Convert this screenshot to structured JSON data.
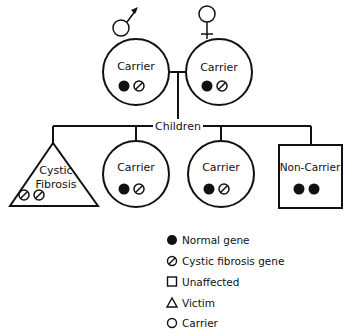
{
  "diagram": {
    "parents": [
      {
        "sex": "male",
        "symbol": "male-symbol",
        "label": "Carrier",
        "genes": [
          "normal",
          "cf"
        ]
      },
      {
        "sex": "female",
        "symbol": "female-symbol",
        "label": "Carrier",
        "genes": [
          "normal",
          "cf"
        ]
      }
    ],
    "children_label": "Children",
    "children": [
      {
        "shape": "triangle",
        "label_line1": "Cystic",
        "label_line2": "Fibrosis",
        "genes": [
          "cf",
          "cf"
        ]
      },
      {
        "shape": "circle",
        "label": "Carrier",
        "genes": [
          "normal",
          "cf"
        ]
      },
      {
        "shape": "circle",
        "label": "Carrier",
        "genes": [
          "normal",
          "cf"
        ]
      },
      {
        "shape": "square",
        "label": "Non-Carrier",
        "genes": [
          "normal",
          "normal"
        ]
      }
    ],
    "legend": [
      {
        "icon": "filled-circle",
        "label": "Normal gene"
      },
      {
        "icon": "slashed-circle",
        "label": "Cystic fibrosis gene"
      },
      {
        "icon": "square",
        "label": "Unaffected"
      },
      {
        "icon": "triangle",
        "label": "Victim"
      },
      {
        "icon": "circle",
        "label": "Carrier"
      }
    ]
  }
}
